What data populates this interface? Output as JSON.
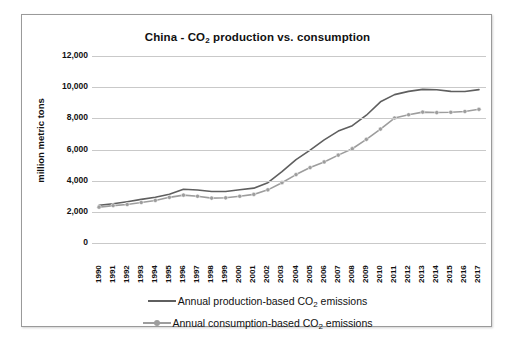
{
  "chart_data": {
    "type": "line",
    "title": "China - CO2 production vs. consumption",
    "title_parts": {
      "pre": "China - CO",
      "sub": "2",
      "post": " production vs. consumption"
    },
    "xlabel": "",
    "ylabel": "million metric tons",
    "ylim": [
      0,
      12000
    ],
    "yticks": [
      0,
      2000,
      4000,
      6000,
      8000,
      10000,
      12000
    ],
    "ytick_labels": [
      "0",
      "2,000",
      "4,000",
      "6,000",
      "8,000",
      "10,000",
      "12,000"
    ],
    "grid": true,
    "legend_position": "bottom",
    "x": [
      1990,
      1991,
      1992,
      1993,
      1994,
      1995,
      1996,
      1997,
      1998,
      1999,
      2000,
      2001,
      2002,
      2003,
      2004,
      2005,
      2006,
      2007,
      2008,
      2009,
      2010,
      2011,
      2012,
      2013,
      2014,
      2015,
      2016,
      2017
    ],
    "categories": [
      "1990",
      "1991",
      "1992",
      "1993",
      "1994",
      "1995",
      "1996",
      "1997",
      "1998",
      "1999",
      "2000",
      "2001",
      "2002",
      "2003",
      "2004",
      "2005",
      "2006",
      "2007",
      "2008",
      "2009",
      "2010",
      "2011",
      "2012",
      "2013",
      "2014",
      "2015",
      "2016",
      "2017"
    ],
    "series": [
      {
        "name": "Annual production-based CO2 emissions",
        "name_parts": {
          "pre": "Annual production-based CO",
          "sub": "2",
          "post": " emissions"
        },
        "color": "#5f5f5f",
        "marker": "none",
        "values": [
          2420,
          2520,
          2650,
          2800,
          2940,
          3130,
          3450,
          3400,
          3300,
          3300,
          3420,
          3520,
          3870,
          4580,
          5350,
          5960,
          6620,
          7180,
          7530,
          8200,
          9060,
          9520,
          9730,
          9860,
          9830,
          9730,
          9720,
          9840
        ]
      },
      {
        "name": "Annual consumption-based CO2 emissions",
        "name_parts": {
          "pre": "Annual consumption-based CO",
          "sub": "2",
          "post": " emissions"
        },
        "color": "#9d9d9d",
        "marker": "circle",
        "values": [
          2300,
          2400,
          2470,
          2600,
          2730,
          2930,
          3070,
          3000,
          2880,
          2900,
          3000,
          3120,
          3410,
          3870,
          4390,
          4840,
          5200,
          5640,
          6050,
          6650,
          7310,
          8020,
          8230,
          8400,
          8370,
          8390,
          8440,
          8580
        ]
      }
    ]
  }
}
